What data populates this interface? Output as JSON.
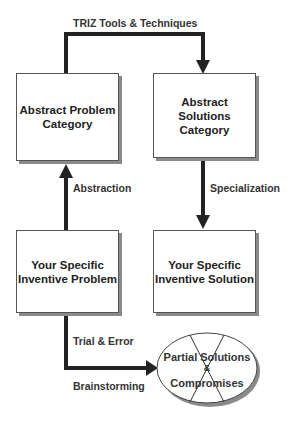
{
  "diagram": {
    "boxes": {
      "abstract_problem": {
        "label": "Abstract Problem Category",
        "line1": "Abstract Problem",
        "line2": "Category"
      },
      "abstract_solutions": {
        "label": "Abstract Solutions Category",
        "line1": "Abstract Solutions",
        "line2": "Category"
      },
      "specific_problem": {
        "label": "Your Specific Inventive Problem",
        "line1": "Your Specific",
        "line2": "Inventive Problem"
      },
      "specific_solution": {
        "label": "Your Specific Inventive Solution",
        "line1": "Your Specific",
        "line2": "Inventive Solution"
      }
    },
    "ellipse": {
      "line1": "Partial Solutions",
      "line2": "&",
      "line3": "Compromises",
      "crossed_out": true
    },
    "edges": {
      "triz": "TRIZ Tools & Techniques",
      "abstraction": "Abstraction",
      "specialization": "Specialization",
      "trial_error": "Trial & Error",
      "brainstorming": "Brainstorming"
    }
  }
}
